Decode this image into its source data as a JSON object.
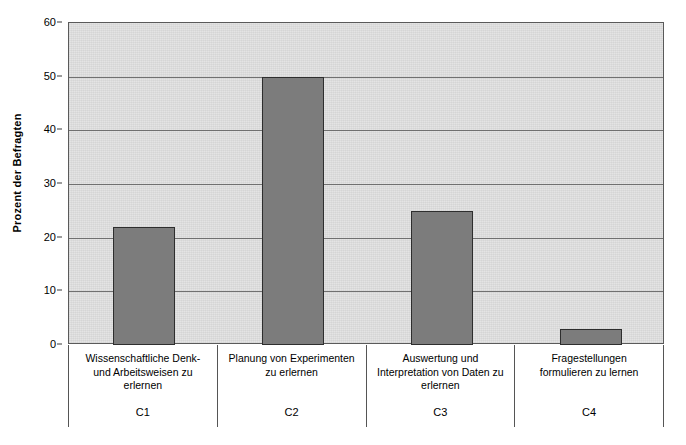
{
  "chart_data": {
    "type": "bar",
    "title": "",
    "xlabel": "",
    "ylabel": "Prozent der Befragten",
    "ylim": [
      0,
      60
    ],
    "yticks": [
      0,
      10,
      20,
      30,
      40,
      50,
      60
    ],
    "ytick_labels": [
      "0",
      "10",
      "20",
      "30",
      "40",
      "50",
      "60"
    ],
    "grid": true,
    "legend": null,
    "categories": [
      "Wissenschaftliche Denk- und Arbeitsweisen zu erlernen",
      "Planung von Experimenten zu erlernen",
      "Auswertung und Interpretation von Daten zu erlernen",
      "Fragestellungen formulieren zu lernen"
    ],
    "category_codes": [
      "C1",
      "C2",
      "C3",
      "C4"
    ],
    "values": [
      22,
      50,
      25,
      3
    ],
    "bar_color": "#7c7c7c",
    "bar_border_color": "#2e2e2e",
    "plot_background": "#e2e2e2",
    "gridline_color": "#707070"
  },
  "axis": {
    "y_title": "Prozent der Befragten"
  },
  "category_lines": [
    [
      "Wissenschaftliche Denk-",
      "und Arbeitsweisen zu",
      "erlernen"
    ],
    [
      "Planung von Experimenten",
      "zu erlernen"
    ],
    [
      "Auswertung und",
      "Interpretation von Daten zu",
      "erlernen"
    ],
    [
      "Fragestellungen",
      "formulieren zu lernen"
    ]
  ]
}
